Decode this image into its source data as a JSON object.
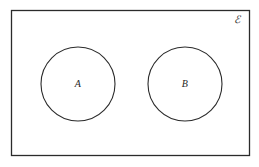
{
  "figure": {
    "kind": "euler-diagram",
    "background_color": "#ffffff",
    "stroke_color": "#2b2b2b",
    "text_color": "#262626"
  },
  "universe": {
    "label": "ℰ",
    "label_name": "universal-set-symbol",
    "label_x": 237,
    "label_y": 19,
    "rect": {
      "x": 11,
      "y": 10,
      "width": 239,
      "height": 146
    }
  },
  "sets": [
    {
      "id": "A",
      "label": "A",
      "cx": 78,
      "cy": 84,
      "r": 37,
      "label_x": 78,
      "label_y": 84
    },
    {
      "id": "B",
      "label": "B",
      "cx": 185,
      "cy": 84,
      "r": 37,
      "label_x": 185,
      "label_y": 84
    }
  ]
}
